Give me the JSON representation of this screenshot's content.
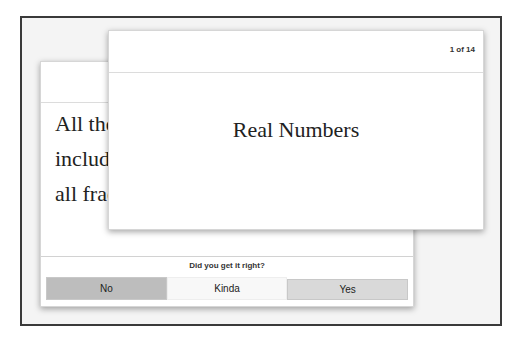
{
  "flashcards": {
    "counter": "1 of 14",
    "front_card": {
      "term": "Real Numbers"
    },
    "back_card": {
      "definition_lines": [
        "All the",
        "includ",
        "all frac"
      ]
    },
    "feedback": {
      "prompt": "Did you get it right?",
      "buttons": {
        "no": "No",
        "kinda": "Kinda",
        "yes": "Yes"
      }
    }
  },
  "colors": {
    "frame_border": "#3a3a3a",
    "frame_bg": "#f4f4f4",
    "no_button": "#bdbdbd",
    "kinda_button": "#f8f8f8",
    "yes_button": "#d9d9d9"
  }
}
